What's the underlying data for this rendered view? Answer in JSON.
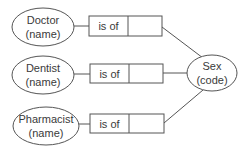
{
  "diagram": {
    "entities": [
      {
        "id": "doctor",
        "name": "Doctor",
        "attribute": "(name)"
      },
      {
        "id": "dentist",
        "name": "Dentist",
        "attribute": "(name)"
      },
      {
        "id": "pharmacist",
        "name": "Pharmacist",
        "attribute": "(name)"
      }
    ],
    "relations": [
      {
        "label": "is of",
        "from": "doctor",
        "to": "sex"
      },
      {
        "label": "is of",
        "from": "dentist",
        "to": "sex"
      },
      {
        "label": "is of",
        "from": "pharmacist",
        "to": "sex"
      }
    ],
    "target": {
      "id": "sex",
      "name": "Sex",
      "attribute": "(code)"
    }
  }
}
